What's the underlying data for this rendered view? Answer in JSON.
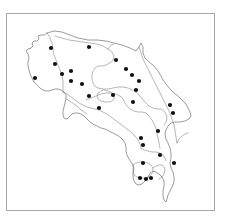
{
  "figure": {
    "title": "",
    "caption": "",
    "background_color": "#ffffff",
    "frame": {
      "visible": true,
      "color": "#a8a8a8",
      "x": 6,
      "y": 13,
      "width": 209,
      "height": 198
    }
  },
  "map": {
    "region_name": "Costa Rica",
    "outline_color": "#4a4a4a",
    "boundary_color": "#6e6e6e",
    "fill_color": "#ffffff",
    "point_color": "#111111",
    "point_radius": 2.1,
    "point_count": 28,
    "legend": {
      "visible": false,
      "entries": []
    },
    "scale_bar": {
      "visible": false,
      "label": ""
    },
    "north_arrow": {
      "visible": false
    },
    "axis_labels": {
      "x": "",
      "y": ""
    }
  },
  "chart_data": {
    "type": "scatter",
    "title": "",
    "xlabel": "",
    "ylabel": "",
    "grid": false,
    "legend_position": "none",
    "xlim": [
      6,
      215
    ],
    "ylim": [
      13,
      211
    ],
    "series": [
      {
        "name": "sample-sites",
        "marker": "filled-circle",
        "color": "#111111",
        "points": [
          {
            "x": 51,
            "y": 48
          },
          {
            "x": 89,
            "y": 47
          },
          {
            "x": 55,
            "y": 64
          },
          {
            "x": 116,
            "y": 60
          },
          {
            "x": 71,
            "y": 71
          },
          {
            "x": 62,
            "y": 74
          },
          {
            "x": 126,
            "y": 69
          },
          {
            "x": 35,
            "y": 78
          },
          {
            "x": 132,
            "y": 75
          },
          {
            "x": 71,
            "y": 81
          },
          {
            "x": 82,
            "y": 84
          },
          {
            "x": 139,
            "y": 81
          },
          {
            "x": 113,
            "y": 95
          },
          {
            "x": 89,
            "y": 96
          },
          {
            "x": 136,
            "y": 90
          },
          {
            "x": 133,
            "y": 102
          },
          {
            "x": 99,
            "y": 108
          },
          {
            "x": 170,
            "y": 105
          },
          {
            "x": 173,
            "y": 113
          },
          {
            "x": 141,
            "y": 138
          },
          {
            "x": 158,
            "y": 131
          },
          {
            "x": 143,
            "y": 145
          },
          {
            "x": 160,
            "y": 155
          },
          {
            "x": 174,
            "y": 163
          },
          {
            "x": 143,
            "y": 163
          },
          {
            "x": 140,
            "y": 178
          },
          {
            "x": 146,
            "y": 179
          },
          {
            "x": 151,
            "y": 178
          }
        ]
      }
    ]
  }
}
